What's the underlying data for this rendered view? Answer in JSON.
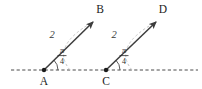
{
  "figure": {
    "background_color": "#ffffff",
    "axis": {
      "name": "horizontal-dashed-axis",
      "style": "dashed",
      "color": "#4a4a4a",
      "y": 70,
      "x_start": 11,
      "x_end": 198
    },
    "points": [
      {
        "id": "A",
        "label": "A",
        "x": 44,
        "y": 70,
        "label_x": 44,
        "label_y": 85,
        "dot": true
      },
      {
        "id": "B",
        "label": "B",
        "x": 95,
        "y": 20,
        "label_x": 100,
        "label_y": 13,
        "dot": false
      },
      {
        "id": "C",
        "label": "C",
        "x": 106,
        "y": 70,
        "label_x": 106,
        "label_y": 85,
        "dot": true
      },
      {
        "id": "D",
        "label": "D",
        "x": 158,
        "y": 20,
        "label_x": 163,
        "label_y": 13,
        "dot": false
      }
    ],
    "vectors": [
      {
        "name": "vector-AB",
        "from": "A",
        "to": "B",
        "color": "#3d3d3d",
        "magnitude_label": "2",
        "magnitude_label_x": 52,
        "magnitude_label_y": 38,
        "angle_numerator": "π",
        "angle_denominator": "4",
        "angle_label_x": 62,
        "angle_label_y": 56,
        "arrowhead": true
      },
      {
        "name": "vector-CD",
        "from": "C",
        "to": "D",
        "color": "#3d3d3d",
        "magnitude_label": "2",
        "magnitude_label_x": 114,
        "magnitude_label_y": 38,
        "angle_numerator": "π",
        "angle_denominator": "4",
        "angle_label_x": 124,
        "angle_label_y": 56,
        "arrowhead": true
      }
    ],
    "sweep_arcs": [
      {
        "name": "sweep-arc-A",
        "color": "#b8b8b8",
        "style": "dashed",
        "from_x": 44,
        "from_y": 70,
        "to_x": 93,
        "to_y": 22
      },
      {
        "name": "sweep-arc-C",
        "color": "#b8b8b8",
        "style": "dashed",
        "from_x": 106,
        "from_y": 70,
        "to_x": 156,
        "to_y": 22
      }
    ],
    "angle_arcs": [
      {
        "name": "angle-arc-A",
        "vertex_x": 44,
        "vertex_y": 70,
        "radius": 14,
        "color": "#4a4a4a"
      },
      {
        "name": "angle-arc-C",
        "vertex_x": 106,
        "vertex_y": 70,
        "radius": 14,
        "color": "#4a4a4a"
      }
    ]
  }
}
